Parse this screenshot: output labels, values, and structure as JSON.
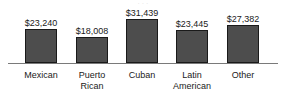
{
  "chart_data": {
    "type": "bar",
    "title": "",
    "xlabel": "",
    "ylabel": "",
    "grid": false,
    "legend": "none",
    "ylim": [
      0,
      35000
    ],
    "categories": [
      "Mexican",
      "Puerto Rican",
      "Cuban",
      "Latin American",
      "Other"
    ],
    "values": [
      23240,
      18008,
      31439,
      23445,
      27382
    ],
    "value_labels": [
      "$23,240",
      "$18,008",
      "$31,439",
      "$23,445",
      "$27,382"
    ],
    "category_lines": [
      [
        "Mexican"
      ],
      [
        "Puerto",
        "Rican"
      ],
      [
        "Cuban"
      ],
      [
        "Latin",
        "American"
      ],
      [
        "Other"
      ]
    ],
    "colors": {
      "bar_fill": "#4d4d4d",
      "bar_border": "#1a1a1a",
      "axis": "#7a7a7a",
      "text": "#1a1a1a",
      "background": "#ffffff"
    },
    "geometry": {
      "baseline_y": 63,
      "bar_width": 32,
      "bars": [
        {
          "left": 25,
          "top": 29
        },
        {
          "left": 76,
          "top": 37
        },
        {
          "left": 126,
          "top": 19
        },
        {
          "left": 176,
          "top": 30
        },
        {
          "left": 227,
          "top": 25
        }
      ],
      "value_label_tops": [
        18,
        26,
        8,
        19,
        14
      ],
      "label_centers": [
        41,
        92,
        142,
        192,
        243
      ]
    }
  },
  "title_sliver": "· · ·"
}
